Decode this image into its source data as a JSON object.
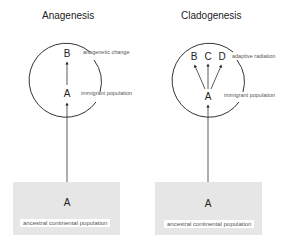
{
  "panels": [
    {
      "title": "Anagenesis",
      "circle_letters": [
        "B",
        "A"
      ],
      "upper_label": "anagenetic change",
      "lower_label": "immigrant population",
      "base_letter": "A",
      "base_label": "ancestral continental population"
    },
    {
      "title": "Cladogenesis",
      "circle_letters": [
        "B",
        "C",
        "D",
        "A"
      ],
      "upper_label": "adaptive radiation",
      "lower_label": "immigrant population",
      "base_letter": "A",
      "base_label": "ancestral continental population"
    }
  ],
  "colors": {
    "line": "#333333",
    "box": "#e6e6e6",
    "text": "#222222"
  }
}
